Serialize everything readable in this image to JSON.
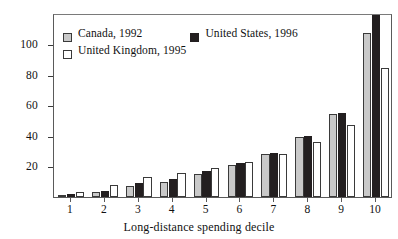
{
  "chart_data": {
    "type": "bar",
    "title": "",
    "xlabel": "Long-distance spending decile",
    "ylabel": "",
    "categories": [
      "1",
      "2",
      "3",
      "4",
      "5",
      "6",
      "7",
      "8",
      "9",
      "10"
    ],
    "series": [
      {
        "name": "Canada, 1992",
        "color": "#c9c9c9",
        "values": [
          1,
          3,
          7,
          10,
          15,
          21,
          28,
          39,
          54,
          107
        ]
      },
      {
        "name": "United States, 1996",
        "color": "#231f20",
        "values": [
          2,
          4,
          9,
          12,
          17,
          22,
          29,
          40,
          55,
          119
        ]
      },
      {
        "name": "United Kingdom, 1995",
        "color": "#ffffff",
        "values": [
          3,
          8,
          13,
          16,
          19,
          23,
          28,
          36,
          47,
          84
        ]
      }
    ],
    "ylim": [
      0,
      115
    ],
    "yticks": [
      20,
      40,
      60,
      80,
      100
    ],
    "ytick_labels": [
      "20",
      "40",
      "60",
      "80",
      "100"
    ],
    "grid": false,
    "legend_position": "top-left-inside",
    "axis_frame": "box"
  },
  "legend": {
    "rows": [
      [
        {
          "label": "Canada, 1992",
          "swatch": "canada-swatch"
        },
        {
          "label": "United States, 1996",
          "swatch": "united-states-swatch"
        }
      ],
      [
        {
          "label": "United Kingdom, 1995",
          "swatch": "united-kingdom-swatch"
        }
      ]
    ]
  }
}
